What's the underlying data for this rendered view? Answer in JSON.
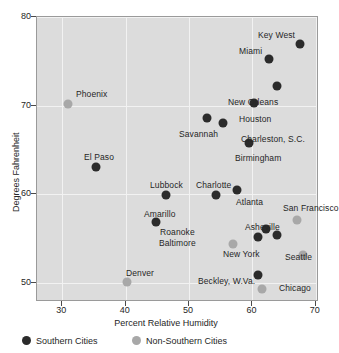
{
  "chart_data": {
    "type": "scatter",
    "title": "",
    "xlabel": "Percent Relative Humidity",
    "ylabel": "Degrees Fahrenheit",
    "xlim": [
      26,
      70.5
    ],
    "ylim": [
      47.8,
      80
    ],
    "xticks": [
      30,
      40,
      50,
      60,
      70
    ],
    "yticks": [
      50,
      60,
      70,
      80
    ],
    "grid": true,
    "legend_position": "bottom",
    "series": [
      {
        "name": "Southern Cities",
        "color": "#2b2b2b",
        "points": [
          {
            "label": "Key West",
            "x": 67.5,
            "y": 77.0,
            "lx": 258,
            "ly": 30
          },
          {
            "label": "Miami",
            "x": 62.6,
            "y": 75.2,
            "lx": 239,
            "ly": 46
          },
          {
            "label": "New Orleans",
            "x": 63.8,
            "y": 72.2,
            "lx": 228,
            "ly": 97
          },
          {
            "label": "Houston",
            "x": 60.3,
            "y": 70.3,
            "lx": 239,
            "ly": 114
          },
          {
            "label": "Charleston, S.C.",
            "x": 55.3,
            "y": 68.0,
            "lx": 241,
            "ly": 134
          },
          {
            "label": "Savannah",
            "x": 52.8,
            "y": 68.6,
            "lx": 179,
            "ly": 129
          },
          {
            "label": "Birmingham",
            "x": 59.4,
            "y": 65.8,
            "lx": 235,
            "ly": 153
          },
          {
            "label": "El Paso",
            "x": 35.3,
            "y": 63.1,
            "lx": 84,
            "ly": 152
          },
          {
            "label": "Charlotte",
            "x": 54.2,
            "y": 59.9,
            "lx": 196,
            "ly": 180
          },
          {
            "label": "Atlanta",
            "x": 57.6,
            "y": 60.4,
            "lx": 236,
            "ly": 197
          },
          {
            "label": "Lubbock",
            "x": 46.3,
            "y": 59.9,
            "lx": 150,
            "ly": 180
          },
          {
            "label": "Amarillo",
            "x": 44.8,
            "y": 56.8,
            "lx": 144,
            "ly": 209
          },
          {
            "label": "Asheville",
            "x": 60.9,
            "y": 55.2,
            "lx": 245,
            "ly": 222
          },
          {
            "label": "Roanoke",
            "x": 62.1,
            "y": 56.1,
            "lx": 160,
            "ly": 227
          },
          {
            "label": "Baltimore",
            "x": 63.8,
            "y": 55.4,
            "lx": 159,
            "ly": 238
          },
          {
            "label": "Beckley, W.Va.",
            "x": 60.9,
            "y": 50.9,
            "lx": 198,
            "ly": 276
          }
        ]
      },
      {
        "name": "Non-Southern Cities",
        "color": "#a8a8a8",
        "points": [
          {
            "label": "Phoenix",
            "x": 30.9,
            "y": 70.2,
            "lx": 76,
            "ly": 89
          },
          {
            "label": "San Francisco",
            "x": 67.0,
            "y": 57.1,
            "lx": 283,
            "ly": 203
          },
          {
            "label": "New York",
            "x": 57.0,
            "y": 54.4,
            "lx": 223,
            "ly": 249
          },
          {
            "label": "Seattle",
            "x": 67.9,
            "y": 53.1,
            "lx": 285,
            "ly": 252
          },
          {
            "label": "Denver",
            "x": 40.2,
            "y": 50.1,
            "lx": 126,
            "ly": 268
          },
          {
            "label": "Chicago",
            "x": 61.5,
            "y": 49.3,
            "lx": 279,
            "ly": 283
          }
        ]
      }
    ]
  },
  "legend": {
    "items": [
      {
        "label": "Southern Cities",
        "swatch": "southern",
        "left": 22
      },
      {
        "label": "Non-Southern Cities",
        "swatch": "nonsouthern",
        "left": 132
      }
    ]
  }
}
